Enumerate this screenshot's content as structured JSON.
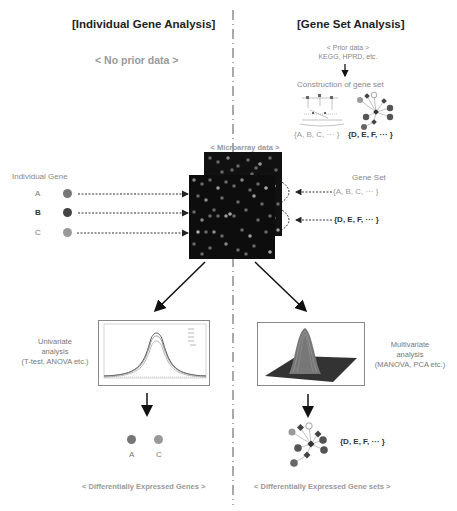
{
  "left": {
    "title": "[Individual Gene Analysis]",
    "prior": "< No prior data >",
    "gene_header": "Individual Gene",
    "genes": [
      {
        "label": "A",
        "color": "#777777"
      },
      {
        "label": "B",
        "color": "#444444"
      },
      {
        "label": "C",
        "color": "#999999"
      }
    ],
    "analysis": {
      "line1": "Univariate",
      "line2": "analysis",
      "line3": "(T-test, ANOVA etc.)"
    },
    "result_genes": [
      {
        "label": "A",
        "color": "#777777"
      },
      {
        "label": "C",
        "color": "#999999"
      }
    ],
    "footer": "< Differentially Expressed Genes >"
  },
  "right": {
    "title": "[Gene Set Analysis]",
    "prior_line1": "< Prior data >",
    "prior_line2": "KEGG, HPRD, etc.",
    "construction": "Construction of gene set",
    "set1": "{A, B, C, ··· }",
    "set2": "{D, E, F, ··· }",
    "gene_set_header": "Gene Set",
    "analysis": {
      "line1": "Multivariate",
      "line2": "analysis",
      "line3": "(MANOVA, PCA etc.)"
    },
    "result_set": "{D, E, F, ··· }",
    "footer": "< Differentially Expressed Gene sets >"
  },
  "center": {
    "microarray": "< Microarray data >"
  }
}
